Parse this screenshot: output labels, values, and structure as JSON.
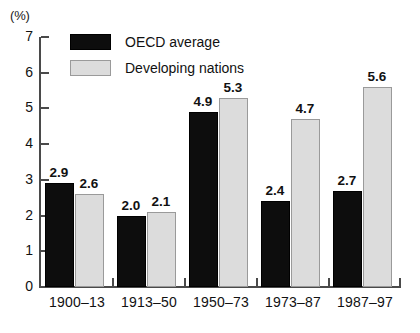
{
  "chart_data": {
    "type": "bar",
    "title": "",
    "subtitle": "",
    "xlabel": "",
    "ylabel": "",
    "unit_label": "(%)",
    "categories": [
      "1900–13",
      "1913–50",
      "1950–73",
      "1973–87",
      "1987–97"
    ],
    "series": [
      {
        "name": "OECD average",
        "color": "#0d0d0d",
        "values": [
          2.9,
          2.0,
          4.9,
          2.4,
          2.7
        ],
        "labels": [
          "2.9",
          "2.0",
          "4.9",
          "2.4",
          "2.7"
        ]
      },
      {
        "name": "Developing nations",
        "color": "#dcdcdc",
        "values": [
          2.6,
          2.1,
          5.3,
          4.7,
          5.6
        ],
        "labels": [
          "2.6",
          "2.1",
          "5.3",
          "4.7",
          "5.6"
        ]
      }
    ],
    "ylim": [
      0,
      7
    ],
    "yticks": [
      0,
      1,
      2,
      3,
      4,
      5,
      6,
      7
    ],
    "ytick_labels": [
      "0",
      "1",
      "2",
      "3",
      "4",
      "5",
      "6",
      "7"
    ],
    "grid": false,
    "legend_position": "top-left-inside"
  },
  "legend": {
    "items": [
      {
        "label": "OECD average",
        "swatch": "black-swatch"
      },
      {
        "label": "Developing nations",
        "swatch": "gray-swatch"
      }
    ]
  },
  "axes": {
    "unit": "(%)"
  }
}
